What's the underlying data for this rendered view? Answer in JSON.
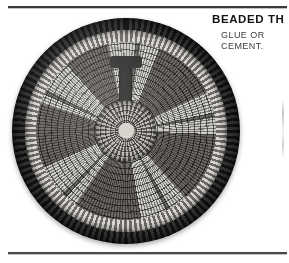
{
  "page": {
    "background_color": "#ffffff",
    "rule_color": "#3a3a3a"
  },
  "article": {
    "heading": "BEADED TH",
    "body_lines": [
      "GLUE OR",
      "CEMENT."
    ]
  },
  "photo": {
    "caption_alt": "beaded-trivet-photograph",
    "colors": {
      "rim_dark": "#121212",
      "bead_light": "#cfcdc7",
      "bead_dark": "#6b6863",
      "center_hub": "#d5d2cc"
    }
  }
}
